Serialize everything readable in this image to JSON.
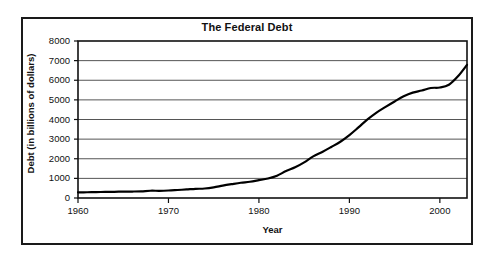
{
  "chart_data": {
    "type": "line",
    "title": "The Federal Debt",
    "xlabel": "Year",
    "ylabel": "Debt (in billions of dollars)",
    "xlim": [
      1960,
      2003
    ],
    "ylim": [
      0,
      8000
    ],
    "xticks": [
      1960,
      1970,
      1980,
      1990,
      2000
    ],
    "yticks": [
      0,
      1000,
      2000,
      3000,
      4000,
      5000,
      6000,
      7000,
      8000
    ],
    "xtick_labels": [
      "1960",
      "1970",
      "1980",
      "1990",
      "2000"
    ],
    "ytick_labels": [
      "0",
      "1000",
      "2000",
      "3000",
      "4000",
      "5000",
      "6000",
      "7000",
      "8000"
    ],
    "grid": "horizontal",
    "legend": "none",
    "line_color": "#000000",
    "line_width": 2.2,
    "series": [
      {
        "name": "Federal Debt",
        "x": [
          1960,
          1961,
          1962,
          1963,
          1964,
          1965,
          1966,
          1967,
          1968,
          1969,
          1970,
          1971,
          1972,
          1973,
          1974,
          1975,
          1976,
          1977,
          1978,
          1979,
          1980,
          1981,
          1982,
          1983,
          1984,
          1985,
          1986,
          1987,
          1988,
          1989,
          1990,
          1991,
          1992,
          1993,
          1994,
          1995,
          1996,
          1997,
          1998,
          1999,
          2000,
          2001,
          2002,
          2003
        ],
        "values": [
          290,
          293,
          303,
          310,
          317,
          323,
          329,
          341,
          370,
          367,
          381,
          408,
          436,
          466,
          484,
          541,
          629,
          706,
          777,
          829,
          909,
          995,
          1137,
          1372,
          1565,
          1818,
          2121,
          2346,
          2601,
          2868,
          3206,
          3598,
          4002,
          4351,
          4644,
          4921,
          5182,
          5369,
          5478,
          5606,
          5629,
          5770,
          6198,
          6783
        ]
      }
    ]
  },
  "axes": {
    "title": "The Federal Debt",
    "x_axis_title": "Year",
    "y_axis_title": "Debt (in billions of dollars)"
  }
}
